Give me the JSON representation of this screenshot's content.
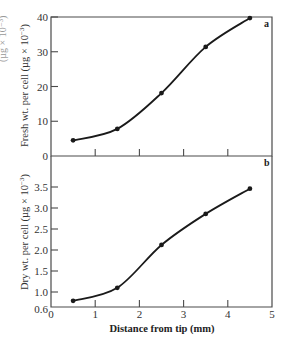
{
  "chart_data": [
    {
      "type": "line",
      "panel_label": "a",
      "title": "",
      "xlabel": "",
      "ylabel": "Fresh wt. per cell (µg × 10⁻³)",
      "x": [
        0.5,
        1.5,
        2.5,
        3.5,
        4.5
      ],
      "series": [
        {
          "name": "Fresh weight",
          "values": [
            4.5,
            7.8,
            18.1,
            31.4,
            39.7
          ]
        }
      ],
      "xlim": [
        0,
        5
      ],
      "ylim": [
        0,
        40
      ],
      "yticks": [
        "0",
        "10",
        "20",
        "30",
        "40"
      ],
      "xticks": [
        1,
        2,
        3,
        4
      ],
      "grid": false,
      "markers": true
    },
    {
      "type": "line",
      "panel_label": "b",
      "title": "",
      "xlabel": "Distance from tip (mm)",
      "ylabel": "Dry wt. per cell (µg × 10⁻³)",
      "x": [
        0.5,
        1.5,
        2.5,
        3.5,
        4.5
      ],
      "series": [
        {
          "name": "Dry weight",
          "values": [
            0.79,
            1.1,
            2.12,
            2.86,
            3.46
          ]
        }
      ],
      "xlim": [
        0,
        5
      ],
      "ylim": [
        0.6,
        3.9
      ],
      "yticks": [
        "0.6",
        "1.0",
        "1.5",
        "2.0",
        "2.5",
        "3.0",
        "3.5"
      ],
      "xticklabels": [
        "0",
        "1",
        "2",
        "3",
        "4",
        "5"
      ],
      "grid": false,
      "markers": true
    }
  ],
  "labels": {
    "panel_a": "a",
    "panel_b": "b",
    "ylabel_a": "Fresh wt. per cell (µg × 10",
    "ylabel_b": "Dry wt. per cell (µg × 10",
    "exp": "−3",
    "close_paren": ")",
    "xlabel": "Distance from tip (mm)",
    "cut_left": "(µg × 10⁻³)"
  }
}
